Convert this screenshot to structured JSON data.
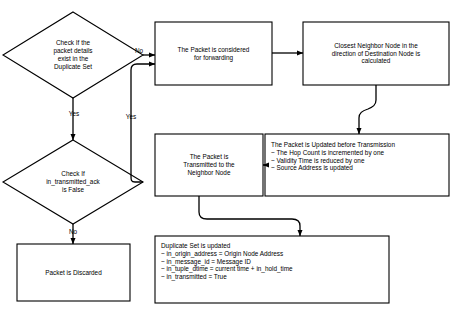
{
  "diagram": {
    "background_color": "#ffffff",
    "stroke_color": "#000000",
    "nodes": {
      "check_duplicate_set": {
        "shape": "decision",
        "text": "Check If the\npacket details\nexist in the\nDuplicate Set"
      },
      "check_transmitted_ack": {
        "shape": "decision",
        "text": "Check If\nin_transmitted_ack\nis False"
      },
      "packet_considered": {
        "shape": "process",
        "text": "The Packet is considered\nfor forwarding"
      },
      "closest_neighbor": {
        "shape": "process",
        "text": "Closest Neighbor Node in the\ndirection of Destination Node is\ncalculated"
      },
      "packet_updated": {
        "shape": "process",
        "text": "The Packet is Updated before Transmission\n~ The Hop Count is incremented by one\n~ Validity Time is reduced by one\n~ Source Address is updated"
      },
      "packet_transmitted": {
        "shape": "process",
        "text": "The Packet is\nTransmitted to the\nNeighbor Node"
      },
      "packet_discarded": {
        "shape": "process",
        "text": "Packet is Discarded"
      },
      "duplicate_set_updated": {
        "shape": "process",
        "text": "Duplicate Set is updated\n~ in_origin_address = Origin Node Address\n~ in_message_id = Message ID\n~ in_tuple_dtime = current time + in_hold_time\n~ in_transmitted = True"
      }
    },
    "edge_labels": {
      "duplicate_no": "No",
      "duplicate_yes": "Yes",
      "ack_yes": "Yes",
      "ack_no": "No"
    }
  }
}
